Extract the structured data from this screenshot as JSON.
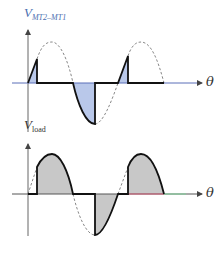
{
  "top_plot": {
    "ylabel_main": "V",
    "ylabel_sub": "MT2–MT1",
    "xlabel": "θ",
    "description": "Voltage across triac MT2-MT1: conducts small slices before triggering each half-cycle"
  },
  "bottom_plot": {
    "ylabel_main": "V",
    "ylabel_sub": "load",
    "xlabel": "θ",
    "description": "Load voltage: shaded portions of sine after trigger angle in each half-cycle"
  },
  "colors": {
    "shade_top": "#b9c8ea",
    "shade_bottom": "#c8c8c8",
    "curve": "#111111",
    "dashed": "#777777",
    "axis": "#555555",
    "label_top": "#4a6fb0"
  }
}
